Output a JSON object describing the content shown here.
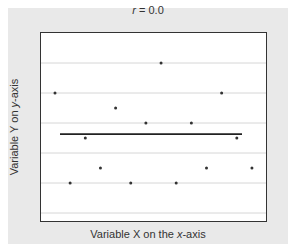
{
  "chart_data": {
    "type": "scatter",
    "title": "r = 0.0",
    "title_parts": {
      "var": "r",
      "rest": " = 0.0"
    },
    "xlabel": "Variable X on the x-axis",
    "xlabel_parts": {
      "pre": "Variable X on the ",
      "var": "x",
      "post": "-axis"
    },
    "ylabel": "Variable Y on y-axis",
    "ylabel_parts": {
      "pre": "Variable Y on ",
      "var": "y",
      "post": "-axis"
    },
    "grid": {
      "horizontal": true,
      "vertical": false,
      "lines_at_y": [
        1,
        2,
        3,
        4,
        5,
        6
      ]
    },
    "xlim": [
      0.1,
      15.0
    ],
    "ylim": [
      0.7,
      7.0
    ],
    "tick_labels_shown": false,
    "points": [
      {
        "x": 1,
        "y": 5.0
      },
      {
        "x": 2,
        "y": 2.0
      },
      {
        "x": 3,
        "y": 3.5
      },
      {
        "x": 4,
        "y": 2.5
      },
      {
        "x": 5,
        "y": 4.5
      },
      {
        "x": 6,
        "y": 2.0
      },
      {
        "x": 7,
        "y": 4.0
      },
      {
        "x": 8,
        "y": 6.0
      },
      {
        "x": 9,
        "y": 2.0
      },
      {
        "x": 10,
        "y": 4.0
      },
      {
        "x": 11,
        "y": 2.5
      },
      {
        "x": 12,
        "y": 5.0
      },
      {
        "x": 13,
        "y": 3.5
      },
      {
        "x": 14,
        "y": 2.5
      }
    ],
    "regression_line": {
      "x_start": 1.4,
      "x_end": 13.4,
      "y": 3.63,
      "slope": 0
    },
    "colors": {
      "background": "#e9e9e9",
      "plot_bg": "#ffffff",
      "grid": "#d6d6d6",
      "points": "#333333",
      "line": "#222222",
      "frame": "#333333"
    }
  }
}
